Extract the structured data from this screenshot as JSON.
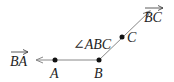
{
  "diagram": {
    "type": "geometry-angle",
    "points": [
      {
        "id": "A",
        "label": "A",
        "x": 55,
        "y": 60
      },
      {
        "id": "B",
        "label": "B",
        "x": 99,
        "y": 60
      },
      {
        "id": "C",
        "label": "C",
        "x": 122,
        "y": 37
      }
    ],
    "rays": [
      {
        "id": "BA",
        "label": "BA",
        "from": "B",
        "through": "A"
      },
      {
        "id": "BC",
        "label": "BC",
        "from": "B",
        "through": "C"
      }
    ],
    "angle": {
      "label": "∠ABC",
      "vertex": "B"
    },
    "colors": {
      "line": "#888888",
      "point": "#111111",
      "text": "#222222"
    }
  }
}
